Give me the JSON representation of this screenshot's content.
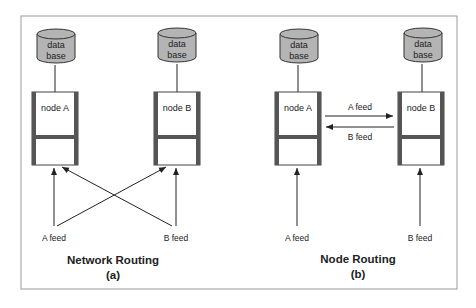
{
  "panels": {
    "a": {
      "title": "Network Routing",
      "subtitle": "(a)",
      "node_a": {
        "label": "node A",
        "db_line1": "data",
        "db_line2": "base"
      },
      "node_b": {
        "label": "node B",
        "db_line1": "data",
        "db_line2": "base"
      },
      "feed_a": "A feed",
      "feed_b": "B feed"
    },
    "b": {
      "title": "Node Routing",
      "subtitle": "(b)",
      "node_a": {
        "label": "node A",
        "db_line1": "data",
        "db_line2": "base"
      },
      "node_b": {
        "label": "node B",
        "db_line1": "data",
        "db_line2": "base"
      },
      "feed_a": "A feed",
      "feed_b": "B feed",
      "arrow_top": "A feed",
      "arrow_bottom": "B feed"
    }
  },
  "colors": {
    "db_fill": "#b4b4b4",
    "node_bar": "#555555",
    "frame": "#9a9a9a",
    "line": "#222222"
  }
}
